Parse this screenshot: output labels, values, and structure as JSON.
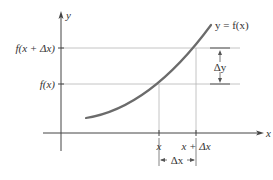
{
  "diagram": {
    "type": "function-increment",
    "axes": {
      "x_label": "x",
      "y_label": "y"
    },
    "curve_label": "y = f(x)",
    "y_ticks": [
      {
        "label": "f(x + Δx)",
        "role": "upper"
      },
      {
        "label": "f(x)",
        "role": "lower"
      }
    ],
    "x_ticks": [
      {
        "label": "x"
      },
      {
        "label": "x + Δx"
      }
    ],
    "delta_y_label": "Δy",
    "delta_x_label": "Δx",
    "colors": {
      "curve": "#6b6b6b",
      "axes": "#444444",
      "guides": "#9a9a9a",
      "text": "#333333"
    }
  }
}
